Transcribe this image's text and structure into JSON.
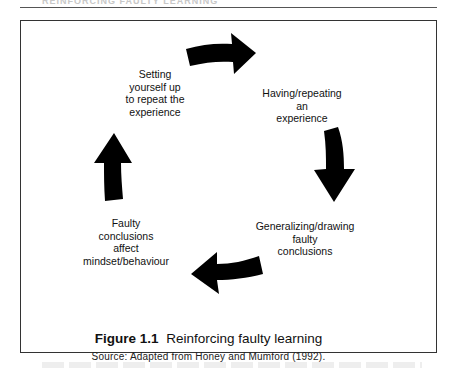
{
  "page": {
    "running_head": "REINFORCING FAULTY LEARNING"
  },
  "figure": {
    "number": "Figure 1.1",
    "title": "Reinforcing faulty learning",
    "source": "Source: Adapted from Honey and Mumford (1992).",
    "cycle_nodes": [
      {
        "id": "setting-up",
        "lines": [
          "Setting",
          "yourself up",
          "to repeat the",
          "experience"
        ]
      },
      {
        "id": "having-repeating",
        "lines": [
          "Having/repeating",
          "an",
          "experience"
        ]
      },
      {
        "id": "generalizing",
        "lines": [
          "Generalizing/drawing",
          "faulty",
          "conclusions"
        ]
      },
      {
        "id": "faulty-conclusions",
        "lines": [
          "Faulty",
          "conclusions",
          "affect",
          "mindset/behaviour"
        ]
      }
    ],
    "arrows": [
      {
        "from": "setting-up",
        "to": "having-repeating",
        "direction": "right"
      },
      {
        "from": "having-repeating",
        "to": "generalizing",
        "direction": "down"
      },
      {
        "from": "generalizing",
        "to": "faulty-conclusions",
        "direction": "left"
      },
      {
        "from": "faulty-conclusions",
        "to": "setting-up",
        "direction": "up"
      }
    ],
    "colors": {
      "arrow_fill": "#000000",
      "border": "#333333",
      "text": "#111111"
    }
  }
}
